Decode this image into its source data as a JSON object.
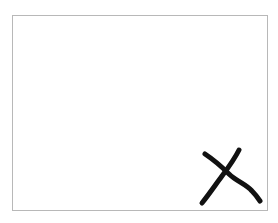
{
  "canvas": {
    "border_color": "#b8b8b8",
    "background": "#ffffff"
  },
  "mark": {
    "icon": "x-mark-icon",
    "glyph": "X",
    "color": "#111111"
  }
}
